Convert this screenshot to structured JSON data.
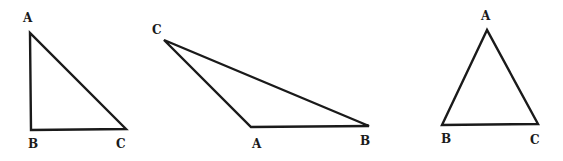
{
  "canvas": {
    "width": 563,
    "height": 161,
    "background": "#ffffff",
    "stroke": "#1a1a1a"
  },
  "triangles": [
    {
      "name": "right-triangle",
      "vertices": {
        "A": {
          "x": 30,
          "y": 33,
          "label_x": 23,
          "label_y": 22
        },
        "B": {
          "x": 31,
          "y": 130,
          "label_x": 28,
          "label_y": 148
        },
        "C": {
          "x": 126,
          "y": 129,
          "label_x": 116,
          "label_y": 148
        }
      },
      "labels": {
        "A": "A",
        "B": "B",
        "C": "C"
      }
    },
    {
      "name": "obtuse-triangle",
      "vertices": {
        "C": {
          "x": 164,
          "y": 40,
          "label_x": 152,
          "label_y": 34
        },
        "A": {
          "x": 251,
          "y": 127,
          "label_x": 252,
          "label_y": 148
        },
        "B": {
          "x": 369,
          "y": 126,
          "label_x": 360,
          "label_y": 145
        }
      },
      "labels": {
        "A": "A",
        "B": "B",
        "C": "C"
      }
    },
    {
      "name": "acute-triangle",
      "vertices": {
        "A": {
          "x": 487,
          "y": 30,
          "label_x": 481,
          "label_y": 20
        },
        "B": {
          "x": 442,
          "y": 125,
          "label_x": 441,
          "label_y": 143
        },
        "C": {
          "x": 538,
          "y": 124,
          "label_x": 530,
          "label_y": 144
        }
      },
      "labels": {
        "A": "A",
        "B": "B",
        "C": "C"
      }
    }
  ]
}
